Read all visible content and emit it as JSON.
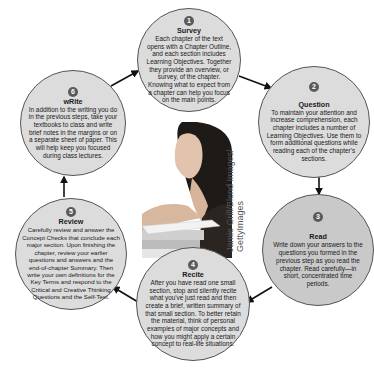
{
  "diagram": {
    "type": "cycle",
    "colors": {
      "circle_fill": "#dcdcdc",
      "circle_fill_highlight": "#c9c9c9",
      "circle_border": "#555555",
      "badge": "#5a5a5a",
      "arrow": "#111111"
    },
    "steps": [
      {
        "number": "1",
        "title": "Survey",
        "body": "Each chapter of the text opens with a Chapter Outline, and each section includes Learning Objectives. Together they provide an overview, or survey, of the chapter. Knowing what to expect from a chapter can help you focus on the main points."
      },
      {
        "number": "2",
        "title": "Question",
        "body": "To maintain your attention and increase comprehension, each chapter includes a number of Learning Objectives. Use them to form additional questions while reading each of the chapter's sections."
      },
      {
        "number": "3",
        "title": "Read",
        "body": "Write down your answers to the questions you formed in the previous step as you read the chapter. Read carefully—in short, concentrated time periods."
      },
      {
        "number": "4",
        "title": "Recite",
        "body": "After you have read one small section, stop and silently recite what you've just read and then create a brief, written summary of that small section. To better retain the material, think of personal examples of major concepts and how you might apply a certain concept to real-life situations."
      },
      {
        "number": "5",
        "title": "Review",
        "body": "Carefully review and answer the Concept Checks that conclude each major section. Upon finishing the chapter, review your earlier questions and answers and the end-of-chapter Summary. Then write your own definitions for the Key Terms and respond to the Critical and Creative Thinking Questions and the Self-Test."
      },
      {
        "number": "6",
        "title": "wRite",
        "body": "In addition to the writing you do in the previous steps, take your textbooks to class and write brief notes in the margins or on a separate sheet of paper. This will help keep you focused during class lectures."
      }
    ],
    "flow": [
      "1→2",
      "2→3",
      "3→4",
      "4→5",
      "5→6",
      "6→1"
    ],
    "photo": {
      "description": "woman studying with books",
      "credit": "Jamie Grill/Blend Images/ GettyImages",
      "credit_line1": "Jamie Grill/Blend Images/",
      "credit_line2": "GettyImages"
    }
  }
}
